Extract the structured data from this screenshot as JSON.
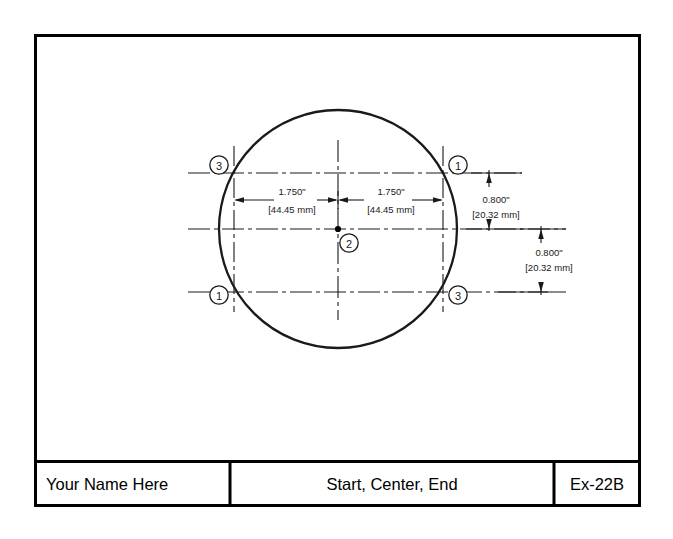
{
  "drawing": {
    "kind": "engineering-drawing-sheet",
    "background_color": "#ffffff",
    "line_color": "#1a1a1a",
    "border_color": "#000000",
    "part_outline": "circle",
    "dimensions": [
      {
        "id": "dim-left-horizontal",
        "inch": "1.750\"",
        "metric": "[44.45 mm]",
        "orientation": "horizontal",
        "position": "left-of-center"
      },
      {
        "id": "dim-right-horizontal",
        "inch": "1.750\"",
        "metric": "[44.45 mm]",
        "orientation": "horizontal",
        "position": "right-of-center"
      },
      {
        "id": "dim-upper-vertical",
        "inch": "0.800\"",
        "metric": "[20.32 mm]",
        "orientation": "vertical",
        "position": "upper-right"
      },
      {
        "id": "dim-lower-vertical",
        "inch": "0.800\"",
        "metric": "[20.32 mm]",
        "orientation": "vertical",
        "position": "lower-right"
      }
    ],
    "callouts": [
      {
        "id": "callout-top-left",
        "label": "3"
      },
      {
        "id": "callout-top-right",
        "label": "1"
      },
      {
        "id": "callout-center",
        "label": "2"
      },
      {
        "id": "callout-bottom-left",
        "label": "1"
      },
      {
        "id": "callout-bottom-right",
        "label": "3"
      }
    ]
  },
  "title_block": {
    "name_field": "Your Name Here",
    "description_field": "Start, Center, End",
    "drawing_number_field": "Ex-22B"
  }
}
